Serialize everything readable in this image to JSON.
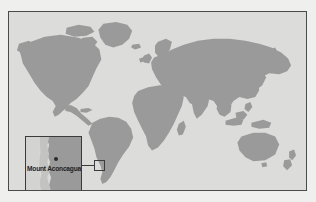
{
  "figure": {
    "type": "locator-map",
    "width": 316,
    "height": 202,
    "background_color": "#efefed"
  },
  "main_map": {
    "name": "world-map",
    "projection": "equirectangular",
    "ocean_color": "#dcdcda",
    "land_color": "#9a9a9a",
    "border_color": "#4a4a4a",
    "frame": {
      "x": 8,
      "y": 11,
      "width": 299,
      "height": 180
    }
  },
  "locator": {
    "box_label": "",
    "box": {
      "x": 85,
      "y": 148,
      "width": 11,
      "height": 11
    },
    "leader_line": {
      "x": 72,
      "y": 153,
      "length": 14
    },
    "color": "#3b3b3b"
  },
  "inset_map": {
    "name": "aconcagua-detail-inset",
    "label": "Mount Aconcagua",
    "marker_type": "peak-dot",
    "marker_color": "#2b2b2b",
    "land_color": "#9a9a9a",
    "ocean_color": "#d9d9d7",
    "border_color": "#3b3b3b",
    "frame": {
      "x": 16,
      "y": 124,
      "width": 57,
      "height": 57
    }
  },
  "landmasses": [
    "North America",
    "South America",
    "Greenland",
    "Europe",
    "Africa",
    "Madagascar",
    "Asia",
    "Japan",
    "Indonesia",
    "Australia",
    "New Zealand",
    "British Isles"
  ]
}
